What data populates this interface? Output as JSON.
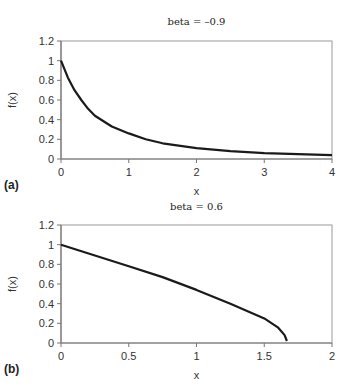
{
  "chart_data": [
    {
      "type": "line",
      "panel_label": "(a)",
      "title": "beta = –0.9",
      "xlabel": "x",
      "ylabel": "f(x)",
      "xlim": [
        0,
        4
      ],
      "ylim": [
        0,
        1.2
      ],
      "xticks": [
        "0",
        "1",
        "2",
        "3",
        "4"
      ],
      "yticks": [
        "0",
        "0.2",
        "0.4",
        "0.6",
        "0.8",
        "1",
        "1.2"
      ],
      "grid": false,
      "legend": null,
      "series": [
        {
          "name": "f(x)",
          "x": [
            0,
            0.1,
            0.2,
            0.3,
            0.4,
            0.5,
            0.75,
            1,
            1.25,
            1.5,
            2,
            2.5,
            3,
            3.5,
            4
          ],
          "y": [
            1.0,
            0.83,
            0.7,
            0.6,
            0.51,
            0.44,
            0.33,
            0.26,
            0.2,
            0.16,
            0.11,
            0.08,
            0.06,
            0.05,
            0.04
          ]
        }
      ]
    },
    {
      "type": "line",
      "panel_label": "(b)",
      "title": "beta = 0.6",
      "xlabel": "x",
      "ylabel": "f(x)",
      "xlim": [
        0,
        2
      ],
      "ylim": [
        0,
        1.2
      ],
      "xticks": [
        "0",
        "0.5",
        "1",
        "1.5",
        "2"
      ],
      "yticks": [
        "0",
        "0.2",
        "0.4",
        "0.6",
        "0.8",
        "1",
        "1.2"
      ],
      "grid": false,
      "legend": null,
      "series": [
        {
          "name": "f(x)",
          "x": [
            0,
            0.25,
            0.5,
            0.75,
            1,
            1.25,
            1.5,
            1.6,
            1.65,
            1.667
          ],
          "y": [
            1.0,
            0.89,
            0.78,
            0.67,
            0.54,
            0.4,
            0.25,
            0.16,
            0.08,
            0.02
          ]
        }
      ]
    }
  ]
}
